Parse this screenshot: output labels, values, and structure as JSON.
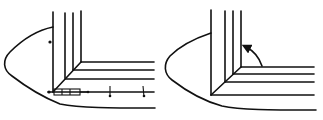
{
  "diagram": {
    "type": "technical line drawing",
    "panels": [
      {
        "id": "left",
        "description": "Nested L-shaped lines with curved bulb outline, measurement markers along vertical and horizontal lines, and a small segmented box at the corner",
        "markers": [
          "dot-on-vertical",
          "dot-at-corner",
          "segmented-box",
          "tick-1",
          "tick-2"
        ]
      },
      {
        "id": "right",
        "description": "Nested L-shaped lines with curved bulb outline and a curved arrow pointing up-left into the inner corner",
        "markers": [
          "curved-arrow"
        ]
      }
    ],
    "colors": {
      "line": "#111111",
      "background": "#ffffff"
    }
  }
}
